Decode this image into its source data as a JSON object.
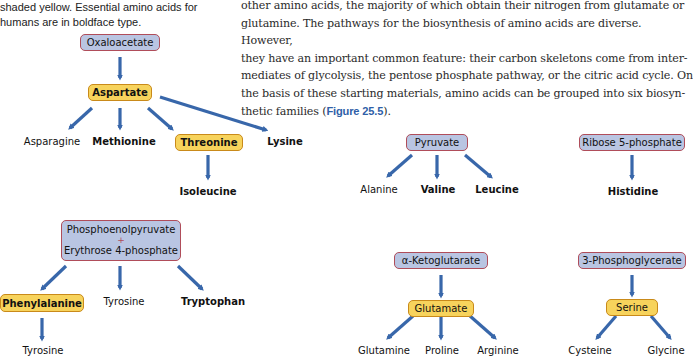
{
  "caption": {
    "line1": "shaded yellow. Essential amino acids for",
    "line2": "humans are in boldface type."
  },
  "body_text": {
    "lines": [
      "other amino acids, the majority of which obtain their nitrogen from glutamate or",
      "glutamine. The pathways for the biosynthesis of amino acids are diverse. However,",
      "they have an important common feature: their carbon skeletons come from inter-",
      "mediates of glycolysis, the pentose phosphate pathway, or the citric acid cycle. On",
      "the basis of these starting materials, amino acids can be grouped into six biosyn-"
    ],
    "last_line_prefix": "thetic families (",
    "figure_ref": "Figure 25.5",
    "last_line_suffix": ")."
  },
  "colors": {
    "precursor_fill": "#b9c5e2",
    "precursor_border": "#b04d5a",
    "intermediate_fill": "#f7d35c",
    "intermediate_border": "#c98a1a",
    "arrow": "#2e5fa6",
    "figure_ref": "#2f5fa8"
  },
  "families": {
    "oxaloacetate": {
      "precursor": "Oxaloacetate",
      "intermediate": "Aspartate",
      "products": [
        "Asparagine",
        "Methionine",
        "Threonine",
        "Lysine"
      ],
      "threonine_product": "Isoleucine"
    },
    "aromatic": {
      "precursor_line1": "Phosphoenolpyruvate",
      "plus": "+",
      "precursor_line2": "Erythrose 4-phosphate",
      "products": [
        "Phenylalanine",
        "Tyrosine",
        "Tryptophan"
      ],
      "phenylalanine_product": "Tyrosine"
    },
    "pyruvate": {
      "precursor": "Pyruvate",
      "products": [
        "Alanine",
        "Valine",
        "Leucine"
      ]
    },
    "ribose": {
      "precursor": "Ribose 5-phosphate",
      "products": [
        "Histidine"
      ]
    },
    "ketoglutarate": {
      "precursor": "α-Ketoglutarate",
      "intermediate": "Glutamate",
      "products": [
        "Glutamine",
        "Proline",
        "Arginine"
      ]
    },
    "phosphoglycerate": {
      "precursor": "3-Phosphoglycerate",
      "intermediate": "Serine",
      "products": [
        "Cysteine",
        "Glycine"
      ]
    }
  }
}
